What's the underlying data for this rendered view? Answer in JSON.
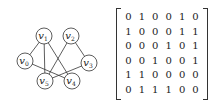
{
  "graph": {
    "nodes": [
      {
        "id": "v0",
        "label": "v",
        "sub": "0",
        "x": 25,
        "y": 61
      },
      {
        "id": "v1",
        "label": "v",
        "sub": "1",
        "x": 44,
        "y": 36
      },
      {
        "id": "v2",
        "label": "v",
        "sub": "2",
        "x": 71,
        "y": 36
      },
      {
        "id": "v3",
        "label": "v",
        "sub": "3",
        "x": 89,
        "y": 63
      },
      {
        "id": "v4",
        "label": "v",
        "sub": "4",
        "x": 72,
        "y": 81
      },
      {
        "id": "v5",
        "label": "v",
        "sub": "5",
        "x": 45,
        "y": 81
      }
    ],
    "edges": [
      [
        "v0",
        "v1"
      ],
      [
        "v0",
        "v4"
      ],
      [
        "v1",
        "v4"
      ],
      [
        "v1",
        "v5"
      ],
      [
        "v2",
        "v3"
      ],
      [
        "v2",
        "v5"
      ],
      [
        "v3",
        "v5"
      ]
    ]
  },
  "matrix": {
    "rows": [
      [
        "0",
        "1",
        "0",
        "0",
        "1",
        "0"
      ],
      [
        "1",
        "0",
        "0",
        "0",
        "1",
        "1"
      ],
      [
        "0",
        "0",
        "0",
        "1",
        "0",
        "1"
      ],
      [
        "0",
        "0",
        "1",
        "0",
        "0",
        "1"
      ],
      [
        "1",
        "1",
        "0",
        "0",
        "0",
        "0"
      ],
      [
        "0",
        "1",
        "1",
        "1",
        "0",
        "0"
      ]
    ]
  }
}
